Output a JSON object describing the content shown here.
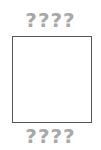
{
  "top_label": "????",
  "bottom_label": "????",
  "colors": {
    "question_marks": "#a8a8a8",
    "box_border": "#555555",
    "background": "#ffffff"
  }
}
